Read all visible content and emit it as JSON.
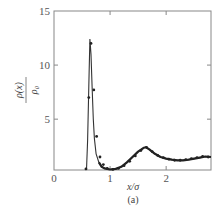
{
  "chart_data": {
    "type": "line",
    "title": "",
    "caption": "(a)",
    "xlabel": "x/σ",
    "ylabel_numerator": "ρ(x)",
    "ylabel_denominator": "ρ₀",
    "xlim": [
      0,
      2.8
    ],
    "ylim": [
      0.3,
      15
    ],
    "x_ticks": [
      0,
      1,
      2
    ],
    "x_tick_labels": [
      "0",
      "1",
      "2"
    ],
    "y_ticks": [
      5,
      10,
      15
    ],
    "y_tick_labels": [
      "5",
      "10",
      "15"
    ],
    "grid": false,
    "legend": null,
    "series": [
      {
        "name": "theory (solid line)",
        "style": "line",
        "x": [
          0.58,
          0.6,
          0.62,
          0.64,
          0.66,
          0.68,
          0.7,
          0.72,
          0.75,
          0.8,
          0.85,
          0.9,
          1.0,
          1.1,
          1.2,
          1.3,
          1.4,
          1.5,
          1.6,
          1.64,
          1.7,
          1.8,
          1.9,
          2.0,
          2.1,
          2.2,
          2.3,
          2.4,
          2.5,
          2.6,
          2.7,
          2.8
        ],
        "y": [
          0.3,
          3.0,
          8.0,
          12.4,
          11.0,
          8.0,
          5.0,
          3.2,
          1.8,
          1.0,
          0.6,
          0.45,
          0.35,
          0.4,
          0.6,
          1.0,
          1.5,
          2.0,
          2.35,
          2.4,
          2.2,
          1.8,
          1.5,
          1.35,
          1.25,
          1.2,
          1.2,
          1.25,
          1.35,
          1.45,
          1.55,
          1.5
        ]
      },
      {
        "name": "simulation (markers)",
        "style": "markers",
        "x": [
          0.57,
          0.62,
          0.66,
          0.71,
          0.76,
          0.82,
          0.88,
          0.95,
          1.05,
          1.15,
          1.25,
          1.35,
          1.45,
          1.55,
          1.65,
          1.75,
          1.85,
          1.95,
          2.05,
          2.15,
          2.25,
          2.35,
          2.45,
          2.55,
          2.65,
          2.75
        ],
        "y": [
          0.4,
          7.0,
          12.0,
          7.7,
          3.4,
          1.5,
          0.8,
          0.45,
          0.35,
          0.45,
          0.7,
          1.1,
          1.6,
          2.1,
          2.4,
          2.0,
          1.65,
          1.45,
          1.3,
          1.2,
          1.2,
          1.25,
          1.35,
          1.45,
          1.55,
          1.5
        ]
      }
    ]
  }
}
